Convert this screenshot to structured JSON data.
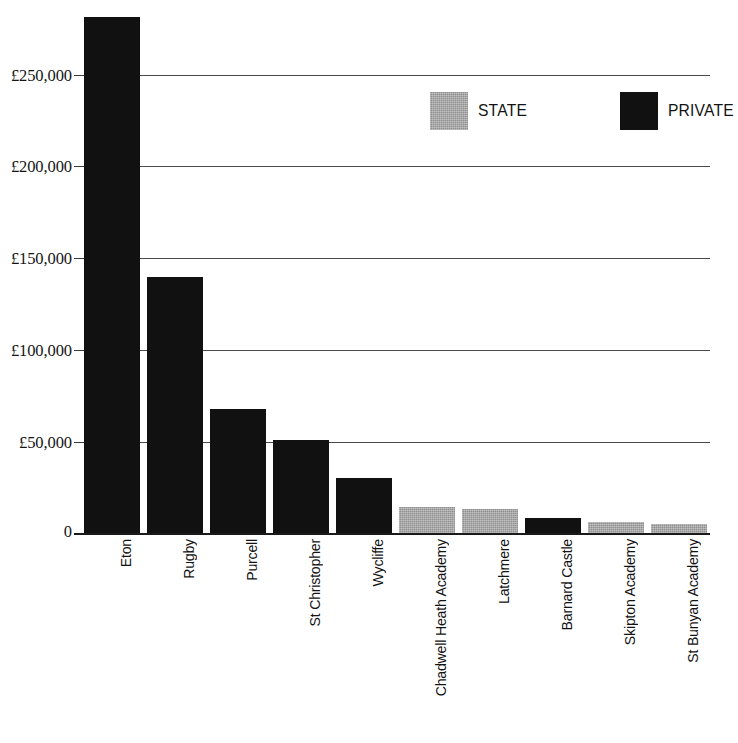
{
  "chart_data": {
    "type": "bar",
    "title": "",
    "subtitle": "",
    "xlabel": "",
    "ylabel": "",
    "grid": true,
    "ylim": [
      0,
      285000
    ],
    "y_axis_visible_max": 285000,
    "yticks": [
      0,
      50000,
      100000,
      150000,
      200000,
      250000
    ],
    "ytick_labels": [
      "0",
      "£50,000",
      "£100,000",
      "£150,000",
      "£200,000",
      "£250,000"
    ],
    "currency_symbol": "£",
    "categories": [
      "Eton",
      "Rugby",
      "Purcell",
      "St Christopher",
      "Wycliffe",
      "Chadwell Heath Academy",
      "Latchmere",
      "Barnard Castle",
      "Skipton Academy",
      "St Bunyan Academy"
    ],
    "values": [
      282000,
      140000,
      68000,
      51000,
      30000,
      14000,
      13000,
      8000,
      6000,
      5000
    ],
    "groups": [
      "PRIVATE",
      "PRIVATE",
      "PRIVATE",
      "PRIVATE",
      "PRIVATE",
      "STATE",
      "STATE",
      "PRIVATE",
      "STATE",
      "STATE"
    ],
    "legend": {
      "position": "top-right",
      "entries": [
        {
          "label": "STATE",
          "color": "#8f8f8f"
        },
        {
          "label": "PRIVATE",
          "color": "#111111"
        }
      ]
    },
    "note_eton_clipped": true
  },
  "legend": {
    "state_label": "STATE",
    "private_label": "PRIVATE"
  },
  "axis": {
    "ytick_labels": [
      "£250,000",
      "£200,000",
      "£150,000",
      "£100,000",
      "£50,000",
      "0"
    ]
  },
  "xaxis": {
    "labels": [
      "Eton",
      "Rugby",
      "Purcell",
      "St Christopher",
      "Wycliffe",
      "Chadwell Heath Academy",
      "Latchmere",
      "Barnard Castle",
      "Skipton Academy",
      "St Bunyan Academy"
    ]
  },
  "colors": {
    "private": "#111111",
    "state": "#8f8f8f",
    "gridline": "#4a4a4a",
    "text": "#131313",
    "background": "#ffffff"
  }
}
